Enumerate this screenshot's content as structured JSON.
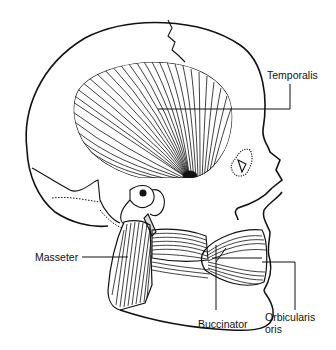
{
  "diagram": {
    "colors": {
      "ink": "#111111",
      "background": "#ffffff"
    },
    "labels": [
      {
        "id": "temporalis",
        "text": "Temporalis"
      },
      {
        "id": "masseter",
        "text": "Masseter"
      },
      {
        "id": "buccinator",
        "text": "Buccinator"
      },
      {
        "id": "orbicularis-oris-line1",
        "text": "Orbicularis"
      },
      {
        "id": "orbicularis-oris-line2",
        "text": "oris"
      }
    ]
  }
}
